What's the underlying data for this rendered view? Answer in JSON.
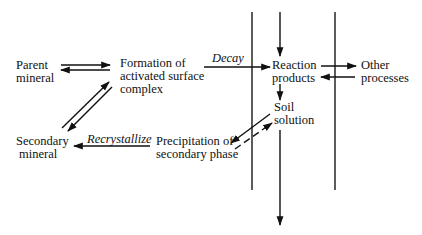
{
  "diagram": {
    "nodes": {
      "parent_mineral": [
        "Parent",
        "mineral"
      ],
      "formation": [
        "Formation of",
        "activated surface",
        "complex"
      ],
      "reaction_products": [
        "Reaction",
        "products"
      ],
      "other_processes": [
        "Other",
        "processes"
      ],
      "soil_solution": [
        "Soil",
        "solution"
      ],
      "secondary_mineral": [
        "Secondary",
        "mineral"
      ],
      "precipitation": [
        "Precipitation of",
        "secondary phase"
      ]
    },
    "edge_labels": {
      "decay": "Decay",
      "recrystallize": "Recrystallize"
    },
    "edges": [
      {
        "from": "Parent mineral",
        "to": "Formation of activated surface complex",
        "type": "reversible"
      },
      {
        "from": "Formation of activated surface complex",
        "to": "Reaction products",
        "label": "Decay"
      },
      {
        "from": "Reaction products",
        "to": "Other processes",
        "type": "reversible"
      },
      {
        "from": "Reaction products",
        "to": "Soil solution"
      },
      {
        "from": "Soil solution",
        "to": "Precipitation of secondary phase",
        "type": "reversible-dashed"
      },
      {
        "from": "Precipitation of secondary phase",
        "to": "Secondary mineral",
        "label": "Recrystallize"
      },
      {
        "from": "Secondary mineral",
        "to": "Formation of activated surface complex",
        "type": "reversible"
      },
      {
        "from": "input (top)",
        "to": "Reaction products"
      },
      {
        "from": "Soil solution",
        "to": "output (bottom)"
      }
    ],
    "colors": {
      "ink": "#111111",
      "boundary": "#333333"
    }
  }
}
